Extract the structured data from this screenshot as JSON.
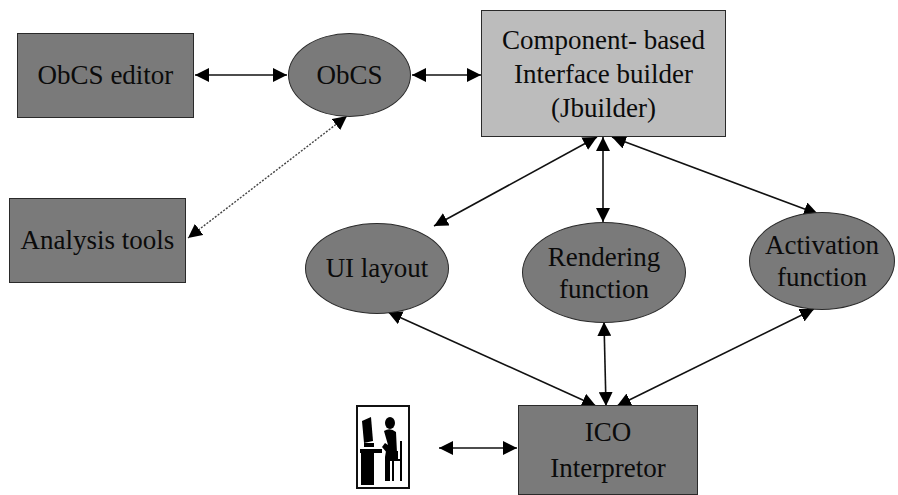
{
  "diagram": {
    "nodes": {
      "obcs_editor": {
        "label": "ObCS editor",
        "shape": "rectangle",
        "fill": "#7a7a7a"
      },
      "obcs": {
        "label": "ObCS",
        "shape": "ellipse",
        "fill": "#7a7a7a"
      },
      "interface_builder": {
        "label": "Component- based\nInterface builder\n(Jbuilder)",
        "shape": "rectangle",
        "fill": "#bcbcbc"
      },
      "analysis_tools": {
        "label": "Analysis tools",
        "shape": "rectangle",
        "fill": "#7a7a7a"
      },
      "ui_layout": {
        "label": "UI layout",
        "shape": "ellipse",
        "fill": "#7a7a7a"
      },
      "rendering_function": {
        "label": "Rendering\nfunction",
        "shape": "ellipse",
        "fill": "#7a7a7a"
      },
      "activation_function": {
        "label": "Activation\nfunction",
        "shape": "ellipse",
        "fill": "#7a7a7a"
      },
      "ico_interpretor": {
        "label": "ICO\nInterpretor",
        "shape": "rectangle",
        "fill": "#7a7a7a"
      },
      "user": {
        "icon": "user-at-computer-icon",
        "shape": "image"
      }
    },
    "edges": [
      {
        "from": "obcs_editor",
        "to": "obcs",
        "style": "solid",
        "direction": "both"
      },
      {
        "from": "obcs",
        "to": "interface_builder",
        "style": "solid",
        "direction": "both"
      },
      {
        "from": "obcs",
        "to": "analysis_tools",
        "style": "dotted",
        "direction": "both"
      },
      {
        "from": "interface_builder",
        "to": "ui_layout",
        "style": "solid",
        "direction": "both"
      },
      {
        "from": "interface_builder",
        "to": "rendering_function",
        "style": "solid",
        "direction": "both"
      },
      {
        "from": "interface_builder",
        "to": "activation_function",
        "style": "solid",
        "direction": "both"
      },
      {
        "from": "ui_layout",
        "to": "ico_interpretor",
        "style": "solid",
        "direction": "both"
      },
      {
        "from": "rendering_function",
        "to": "ico_interpretor",
        "style": "solid",
        "direction": "both"
      },
      {
        "from": "activation_function",
        "to": "ico_interpretor",
        "style": "solid",
        "direction": "both"
      },
      {
        "from": "user",
        "to": "ico_interpretor",
        "style": "solid",
        "direction": "both"
      }
    ]
  }
}
